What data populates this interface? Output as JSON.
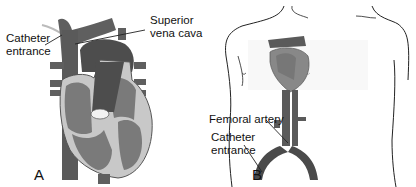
{
  "panel_a": {
    "letter": "A",
    "labels": {
      "catheter_entrance_1": "Catheter",
      "catheter_entrance_2": "entrance",
      "svc_1": "Superior",
      "svc_2": "vena cava"
    }
  },
  "panel_b": {
    "letter": "B",
    "labels": {
      "femoral_artery": "Femoral artery",
      "catheter_entrance_1": "Catheter",
      "catheter_entrance_2": "entrance"
    }
  },
  "colors": {
    "vessel": "#5f5f5f",
    "heart_dark": "#4d4d4d",
    "chamber": "#7a7a7a",
    "wall": "#c8c8c8",
    "outline": "#222222"
  }
}
